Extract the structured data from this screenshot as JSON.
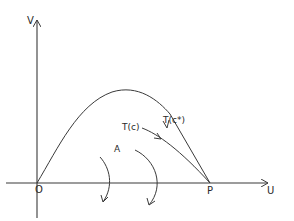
{
  "diagram": {
    "axes": {
      "y_label": "V",
      "x_label": "U"
    },
    "points": {
      "origin": "O",
      "endpoint": "P"
    },
    "curves": {
      "upper": "T(c*)",
      "lower": "T(c)"
    },
    "region_label": "A",
    "colors": {
      "line": "#3a3a3a",
      "background": "#ffffff"
    }
  }
}
